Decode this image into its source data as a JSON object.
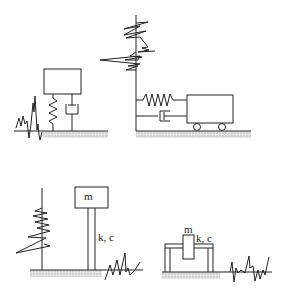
{
  "diagram": {
    "panels": [
      {
        "id": "vertical-mass-spring-damper",
        "labels": []
      },
      {
        "id": "horizontal-cart-spring-damper",
        "labels": []
      },
      {
        "id": "cantilever-column-mass",
        "labels": {
          "mass": "m",
          "stiffness_damping": "k, c"
        }
      },
      {
        "id": "frame-mass",
        "labels": {
          "mass": "m",
          "stiffness_damping": "k, c"
        }
      }
    ],
    "colors": {
      "line": "#222222",
      "hatch": "#bbbbbb"
    }
  }
}
